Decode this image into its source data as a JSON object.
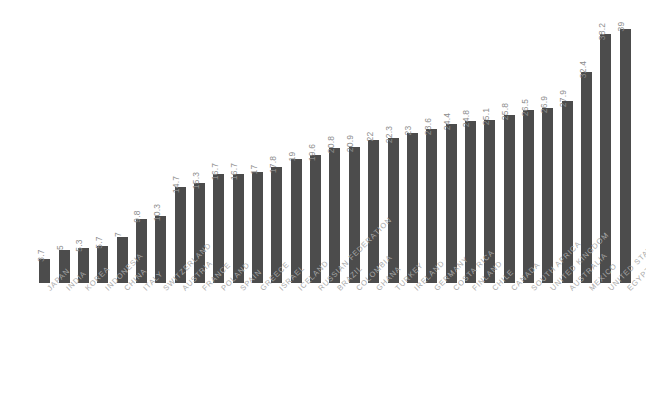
{
  "chart_data": {
    "type": "bar",
    "title": "",
    "subtitle": "",
    "xlabel": "",
    "ylabel": "",
    "ylim": [
      0,
      39
    ],
    "grid": false,
    "legend": "none",
    "orientation": "vertical",
    "bar_color": "#4c4c4c",
    "value_label_color": "#8c8c8c",
    "category_label_color": "#a8a8a8",
    "value_label_rotation": -90,
    "category_label_rotation": -45,
    "categories": [
      "JAPAN",
      "INDIA",
      "KOREA",
      "INDONESIA",
      "CHINA",
      "ITALY",
      "SWITZERLAND",
      "AUSTRIA",
      "FRANCE",
      "POLAND",
      "SPAIN",
      "GREECE",
      "ISRAEL",
      "ICELAND",
      "RUSSIAN FEDERATION",
      "BRAZIL",
      "COLOMBIA",
      "GHANA",
      "TURKEY",
      "IRELAND",
      "GERMANY",
      "COSTA RICA",
      "FINLAND",
      "CHILE",
      "CANADA",
      "SOUTH AFRICA",
      "UNITED KINGDOM",
      "AUSTRALIA",
      "MEXICO",
      "UNITED STATES",
      "EGYPT"
    ],
    "values": [
      3.7,
      5,
      5.3,
      5.7,
      7,
      9.8,
      10.3,
      14.7,
      15.3,
      16.7,
      16.7,
      17,
      17.8,
      19,
      19.6,
      20.8,
      20.9,
      22,
      22.3,
      23,
      23.6,
      24.4,
      24.8,
      25.1,
      25.8,
      26.5,
      26.9,
      27.9,
      32.4,
      38.2,
      39
    ],
    "value_labels": [
      "3.7",
      "5",
      "5.3",
      "5.7",
      "7",
      "9.8",
      "10.3",
      "14.7",
      "15.3",
      "16.7",
      "16.7",
      "17",
      "17.8",
      "19",
      "19.6",
      "20.8",
      "20.9",
      "22",
      "22.3",
      "23",
      "23.6",
      "24.4",
      "24.8",
      "25.1",
      "25.8",
      "26.5",
      "26.9",
      "27.9",
      "32.4",
      "38.2",
      "39"
    ]
  }
}
